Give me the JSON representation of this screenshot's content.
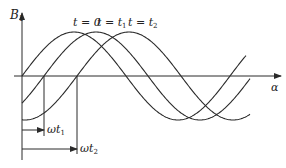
{
  "axes": {
    "y_label": "B",
    "y_label_sub": "1",
    "x_label": "α"
  },
  "curves": [
    {
      "label": "t = 0",
      "zero_x": 22
    },
    {
      "label": "t = t",
      "label_sub": "1",
      "zero_x": 44
    },
    {
      "label": "t = t",
      "label_sub": "2",
      "zero_x": 77
    }
  ],
  "markers": [
    {
      "label": "ωt",
      "label_sub": "1"
    },
    {
      "label": "ωt",
      "label_sub": "2"
    }
  ],
  "colors": {
    "line": "#2a2a2a",
    "text": "#222222"
  }
}
